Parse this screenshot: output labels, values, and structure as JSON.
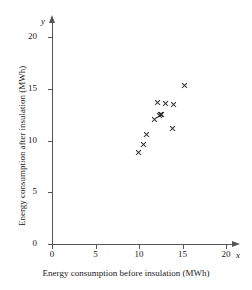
{
  "chart_data": {
    "type": "scatter",
    "title": "",
    "xlabel": "Energy consumption before insulation (MWh)",
    "ylabel": "Energy consumption after insulation (MWh)",
    "x_axis_letter": "x",
    "y_axis_letter": "y",
    "xlim": [
      0,
      20
    ],
    "ylim": [
      0,
      20
    ],
    "xticks": [
      0,
      5,
      10,
      15,
      20
    ],
    "yticks": [
      0,
      5,
      10,
      15,
      20
    ],
    "xtick_labels": [
      "0",
      "5",
      "10",
      "15",
      "20"
    ],
    "ytick_labels": [
      "0",
      "5",
      "10",
      "15",
      "20"
    ],
    "grid": false,
    "legend": false,
    "marker": "x",
    "marker_color": "#262626",
    "points": [
      {
        "x": 9.9,
        "y": 8.8
      },
      {
        "x": 10.5,
        "y": 9.6
      },
      {
        "x": 10.9,
        "y": 10.6
      },
      {
        "x": 11.8,
        "y": 12.0
      },
      {
        "x": 12.1,
        "y": 13.7
      },
      {
        "x": 12.3,
        "y": 12.4
      },
      {
        "x": 12.5,
        "y": 12.5
      },
      {
        "x": 12.6,
        "y": 12.5
      },
      {
        "x": 13.1,
        "y": 13.6
      },
      {
        "x": 13.9,
        "y": 11.2
      },
      {
        "x": 14.0,
        "y": 13.5
      },
      {
        "x": 15.2,
        "y": 15.3
      }
    ]
  }
}
